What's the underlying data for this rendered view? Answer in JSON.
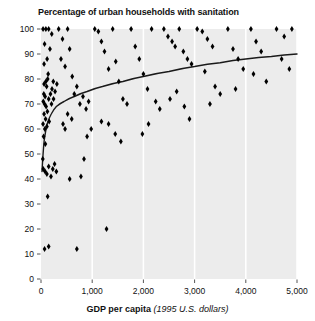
{
  "chart_data": {
    "type": "scatter",
    "title": "Percentage of urban households with sanitation",
    "xlabel_bold": "GDP per capita",
    "xlabel_italic": "(1995 U.S. dollars)",
    "ylabel": "",
    "xlim": [
      0,
      5000
    ],
    "ylim": [
      0,
      100
    ],
    "xticks": [
      0,
      1000,
      2000,
      3000,
      4000,
      5000
    ],
    "xtick_labels": [
      "0",
      "1,000",
      "2,000",
      "3,000",
      "4,000",
      "5,000"
    ],
    "yticks": [
      0,
      10,
      20,
      30,
      40,
      50,
      60,
      70,
      80,
      90,
      100
    ],
    "ytick_labels": [
      "0",
      "10",
      "20",
      "30",
      "40",
      "50",
      "60",
      "70",
      "80",
      "90",
      "100"
    ],
    "grid": "vertical-white",
    "legend": "none",
    "marker": "diamond",
    "marker_color": "#000000",
    "plot_background": "#ececec",
    "gridline_color": "#ffffff",
    "points": [
      [
        40,
        100
      ],
      [
        70,
        94
      ],
      [
        95,
        100
      ],
      [
        120,
        88
      ],
      [
        60,
        86
      ],
      [
        150,
        100
      ],
      [
        210,
        98
      ],
      [
        175,
        92
      ],
      [
        140,
        82
      ],
      [
        95,
        79
      ],
      [
        60,
        78
      ],
      [
        55,
        74
      ],
      [
        80,
        73
      ],
      [
        110,
        77
      ],
      [
        130,
        80
      ],
      [
        45,
        71
      ],
      [
        70,
        70
      ],
      [
        100,
        69
      ],
      [
        150,
        72
      ],
      [
        185,
        74
      ],
      [
        215,
        76
      ],
      [
        240,
        79
      ],
      [
        60,
        66
      ],
      [
        90,
        64
      ],
      [
        125,
        67
      ],
      [
        40,
        62
      ],
      [
        75,
        60
      ],
      [
        115,
        61
      ],
      [
        160,
        63
      ],
      [
        205,
        70
      ],
      [
        245,
        72
      ],
      [
        275,
        75
      ],
      [
        310,
        78
      ],
      [
        50,
        57
      ],
      [
        85,
        54
      ],
      [
        35,
        48
      ],
      [
        45,
        44
      ],
      [
        80,
        43
      ],
      [
        115,
        42
      ],
      [
        150,
        45
      ],
      [
        195,
        41
      ],
      [
        230,
        44
      ],
      [
        265,
        46
      ],
      [
        300,
        43
      ],
      [
        130,
        33
      ],
      [
        70,
        12
      ],
      [
        150,
        13
      ],
      [
        345,
        100
      ],
      [
        420,
        96
      ],
      [
        390,
        88
      ],
      [
        470,
        85
      ],
      [
        520,
        100
      ],
      [
        560,
        92
      ],
      [
        610,
        81
      ],
      [
        650,
        74
      ],
      [
        700,
        77
      ],
      [
        760,
        70
      ],
      [
        820,
        73
      ],
      [
        880,
        68
      ],
      [
        930,
        71
      ],
      [
        980,
        60
      ],
      [
        900,
        57
      ],
      [
        840,
        48
      ],
      [
        780,
        41
      ],
      [
        700,
        12
      ],
      [
        560,
        40
      ],
      [
        470,
        60
      ],
      [
        430,
        62
      ],
      [
        520,
        66
      ],
      [
        600,
        64
      ],
      [
        1050,
        100
      ],
      [
        1120,
        99
      ],
      [
        1180,
        95
      ],
      [
        1240,
        91
      ],
      [
        1320,
        84
      ],
      [
        1400,
        100
      ],
      [
        1460,
        87
      ],
      [
        1520,
        79
      ],
      [
        1600,
        72
      ],
      [
        1680,
        70
      ],
      [
        1180,
        63
      ],
      [
        1320,
        62
      ],
      [
        1450,
        58
      ],
      [
        1560,
        55
      ],
      [
        1280,
        20
      ],
      [
        1760,
        100
      ],
      [
        1840,
        93
      ],
      [
        1920,
        88
      ],
      [
        2000,
        82
      ],
      [
        2080,
        76
      ],
      [
        2160,
        100
      ],
      [
        2240,
        71
      ],
      [
        2320,
        68
      ],
      [
        2100,
        62
      ],
      [
        1980,
        58
      ],
      [
        2400,
        100
      ],
      [
        2480,
        97
      ],
      [
        2560,
        95
      ],
      [
        2620,
        93
      ],
      [
        2700,
        100
      ],
      [
        2780,
        91
      ],
      [
        2860,
        88
      ],
      [
        2940,
        86
      ],
      [
        2650,
        75
      ],
      [
        2520,
        72
      ],
      [
        2800,
        69
      ],
      [
        2900,
        64
      ],
      [
        3050,
        100
      ],
      [
        3150,
        99
      ],
      [
        3250,
        96
      ],
      [
        3350,
        93
      ],
      [
        3200,
        83
      ],
      [
        3400,
        77
      ],
      [
        3500,
        74
      ],
      [
        3300,
        70
      ],
      [
        3650,
        100
      ],
      [
        3750,
        92
      ],
      [
        3850,
        88
      ],
      [
        3950,
        84
      ],
      [
        3800,
        76
      ],
      [
        4100,
        100
      ],
      [
        4200,
        95
      ],
      [
        4300,
        91
      ],
      [
        4150,
        82
      ],
      [
        4400,
        79
      ],
      [
        4600,
        100
      ],
      [
        4750,
        97
      ],
      [
        4900,
        100
      ],
      [
        4700,
        88
      ],
      [
        4850,
        84
      ]
    ],
    "trend_curve": {
      "description": "fitted logarithmic trend line",
      "color": "#1a1a1a",
      "points": [
        [
          20,
          43
        ],
        [
          60,
          55
        ],
        [
          120,
          62
        ],
        [
          200,
          66
        ],
        [
          300,
          69
        ],
        [
          450,
          71
        ],
        [
          650,
          73
        ],
        [
          900,
          75
        ],
        [
          1200,
          77
        ],
        [
          1600,
          79
        ],
        [
          2000,
          81
        ],
        [
          2500,
          83
        ],
        [
          3000,
          85
        ],
        [
          3500,
          86.5
        ],
        [
          4000,
          88
        ],
        [
          4500,
          89
        ],
        [
          5000,
          90
        ]
      ]
    }
  }
}
